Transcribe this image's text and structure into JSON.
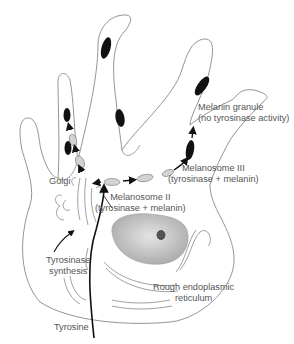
{
  "diagram": {
    "labels": {
      "melanin_granule_line1": "Melanin granule",
      "melanin_granule_line2": "(no tyrosinase activity)",
      "melanosome3_line1": "Melanosome III",
      "melanosome3_line2": "(tyrosinase + melanin)",
      "melanosome2_line1": "Melanosome II",
      "melanosome2_line2": "(tyrosinase + melanin)",
      "golgi": "Golgi",
      "tyrosinase_synthesis_line1": "Tyrosinase",
      "tyrosinase_synthesis_line2": "synthesis",
      "rer_line1": "Rough endoplasmic",
      "rer_line2": "reticulum",
      "tyrosine": "Tyrosine"
    },
    "colors": {
      "outline": "#888888",
      "granule": "#111111",
      "vesicle": "#cccccc",
      "nucleus": "#bbbbbb",
      "text": "#555555"
    }
  }
}
